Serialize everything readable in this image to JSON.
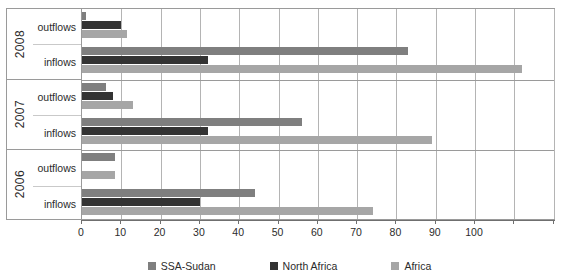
{
  "chart_data": {
    "type": "bar",
    "orientation": "horizontal",
    "title": "",
    "subtitle": "",
    "xlabel": "",
    "ylabel": "",
    "xlim": [
      0,
      120.6
    ],
    "grid": true,
    "legend_position": "bottom",
    "xticks": [
      0,
      10,
      20,
      30,
      40,
      50,
      60,
      70,
      80,
      90,
      100,
      110,
      120
    ],
    "xticklabels": [
      "0",
      "10",
      "20",
      "30",
      "40",
      "50",
      "60",
      "70",
      "80",
      "90",
      "100",
      "",
      ""
    ],
    "categories": [
      "2008 outflows",
      "2008 inflows",
      "2007 outflows",
      "2007 inflows",
      "2006 outflows",
      "2006 inflows"
    ],
    "groups": [
      {
        "year": "2008",
        "rows": [
          {
            "label": "outflows",
            "values": [
              1,
              10,
              11.5
            ]
          },
          {
            "label": "inflows",
            "values": [
              83,
              32,
              112
            ]
          }
        ]
      },
      {
        "year": "2007",
        "rows": [
          {
            "label": "outflows",
            "values": [
              6,
              8,
              13
            ]
          },
          {
            "label": "inflows",
            "values": [
              56,
              32,
              89
            ]
          }
        ]
      },
      {
        "year": "2006",
        "rows": [
          {
            "label": "outflows",
            "values": [
              8.5,
              0,
              8.5
            ]
          },
          {
            "label": "inflows",
            "values": [
              44,
              30,
              74
            ]
          }
        ]
      }
    ],
    "series": [
      {
        "name": "SSA-Sudan",
        "color": "#7f7f7f",
        "values": [
          1,
          83,
          6,
          56,
          8.5,
          44
        ]
      },
      {
        "name": "North Africa",
        "color": "#333333",
        "values": [
          10,
          32,
          8,
          32,
          0,
          30
        ]
      },
      {
        "name": "Africa",
        "color": "#a6a6a6",
        "values": [
          11.5,
          112,
          13,
          89,
          8.5,
          74
        ]
      }
    ]
  },
  "legend": {
    "items": [
      {
        "label": "SSA-Sudan",
        "color": "#7f7f7f",
        "swatch_name": "legend-swatch-ssa-sudan"
      },
      {
        "label": "North Africa",
        "color": "#333333",
        "swatch_name": "legend-swatch-north-africa"
      },
      {
        "label": "Africa",
        "color": "#a6a6a6",
        "swatch_name": "legend-swatch-africa"
      }
    ]
  },
  "colors": {
    "ssa_sudan": "#7f7f7f",
    "north_africa": "#333333",
    "africa": "#a6a6a6",
    "gridline": "#b4b4b4",
    "axis": "#6f6f6f",
    "border": "#9a9a9a",
    "background": "#ffffff"
  }
}
